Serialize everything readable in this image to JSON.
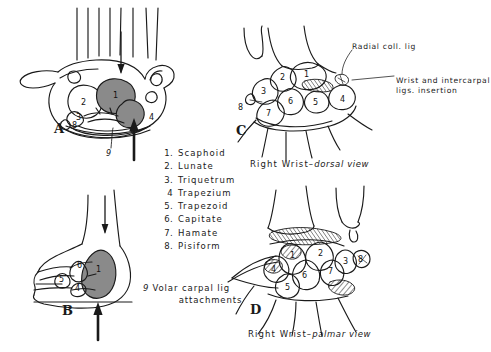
{
  "figure": {
    "type": "anatomical-line-drawing",
    "background_color": "#ffffff",
    "ink_color": "#1a1a1a",
    "shade_color": "#8a8a8a"
  },
  "panels": [
    {
      "letter": "A",
      "view": "axial cross-section of hand showing carpal tunnel",
      "bone_numbers": [
        "2",
        "3",
        "8",
        "1",
        "4"
      ],
      "callout_number": "9",
      "arrows": [
        "thin-down-arrow",
        "bold-up-arrow"
      ]
    },
    {
      "letter": "B",
      "view": "lateral view of wrist",
      "bone_numbers": [
        "6",
        "5",
        "4",
        "1"
      ],
      "arrows": [
        "thin-down-arrow",
        "bold-up-arrow"
      ]
    },
    {
      "letter": "C",
      "view": "dorsal view",
      "caption_prefix": "Right Wrist",
      "caption_dash": "–",
      "caption_view": "dorsal view",
      "bone_numbers": [
        "2",
        "1",
        "3",
        "6",
        "5",
        "4",
        "8",
        "7"
      ],
      "annotations": [
        {
          "text": "Radial coll. lig"
        },
        {
          "text": "Wrist and intercarpal"
        },
        {
          "text": "ligs. insertion"
        }
      ]
    },
    {
      "letter": "D",
      "view": "palmar view",
      "caption_prefix": "Right Wrist",
      "caption_dash": "–",
      "caption_view": "palmar view",
      "bone_numbers": [
        "1",
        "2",
        "3",
        "8",
        "4",
        "6",
        "7",
        "5"
      ]
    }
  ],
  "legend": {
    "items": [
      {
        "num": "1.",
        "name": "Scaphoid"
      },
      {
        "num": "2.",
        "name": "Lunate"
      },
      {
        "num": "3.",
        "name": "Triquetrum"
      },
      {
        "num": "4",
        "name": "Trapezium"
      },
      {
        "num": "5.",
        "name": "Trapezoid"
      },
      {
        "num": "6.",
        "name": "Capitate"
      },
      {
        "num": "7.",
        "name": "Hamate"
      },
      {
        "num": "8.",
        "name": "Pisiform"
      }
    ],
    "footnote": {
      "num": "9",
      "line1": "Volar carpal lig",
      "line2": "attachments"
    }
  }
}
